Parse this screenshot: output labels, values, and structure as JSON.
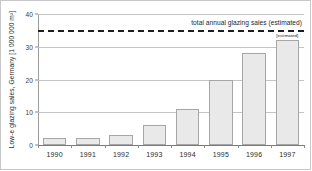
{
  "chart_data": {
    "type": "bar",
    "title": "",
    "xlabel": "",
    "ylabel": "Low-e glazing sales, Germany [1 000 000 m²]",
    "categories": [
      "1990",
      "1991",
      "1992",
      "1993",
      "1994",
      "1995",
      "1996",
      "1997"
    ],
    "values": [
      2,
      2,
      3,
      6,
      11,
      20,
      28,
      32
    ],
    "ylim": [
      0,
      40
    ],
    "yticks": [
      0,
      10,
      20,
      30,
      40
    ],
    "ytick_labels": [
      "0",
      "10",
      "20",
      "30",
      "40"
    ],
    "grid": true,
    "legend": "none",
    "reference_line": {
      "value": 35,
      "style": "dashed",
      "color": "#1d1d1d",
      "label": "total annual glazing sales (estimated)"
    },
    "annotations": [
      {
        "category": "1997",
        "text": "[estimated]"
      }
    ]
  },
  "colors": {
    "bar_fill": "#e9e9e9",
    "bar_stroke": "#a6a6a6",
    "gridline": "#c4c4c4",
    "axis": "#7a7a7a",
    "text": "#2b2b2b",
    "frame": "#c8c8c8"
  }
}
